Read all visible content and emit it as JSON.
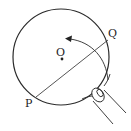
{
  "diagram": {
    "title": "",
    "labels": {
      "center": "O",
      "point_p": "P",
      "point_q": "Q"
    },
    "elements": {
      "circle": {
        "cx": 61,
        "cy": 57,
        "r": 48
      },
      "chord": {
        "from": "P",
        "to": "Q"
      },
      "arrow": "curved fold arrow from lower-right toward upper-left",
      "hand": "finger pressing circle edge at lower right"
    },
    "colors": {
      "stroke": "#2a2a2a",
      "background": "#ffffff"
    }
  }
}
